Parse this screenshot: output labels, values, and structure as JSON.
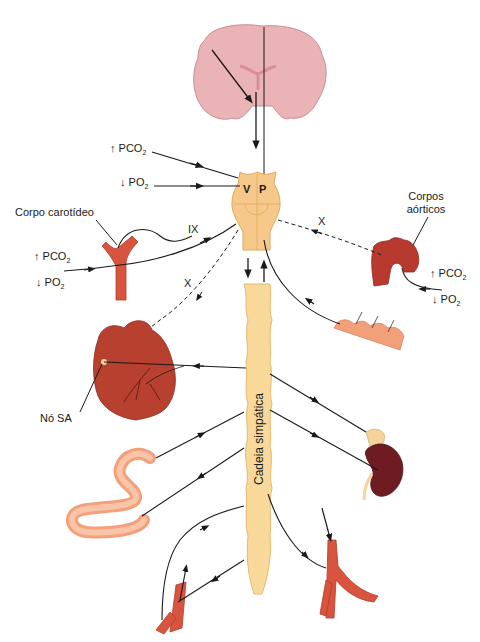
{
  "diagram": {
    "type": "physiology-diagram",
    "colors": {
      "brain": "#eab4b6",
      "brainstem": "#f6c98a",
      "chain": "#f8d99a",
      "vessel": "#d9543f",
      "heart": "#b8402f",
      "intestine": "#f4a07a",
      "skin": "#f2a07a",
      "kidney": "#6e1c22",
      "adrenal": "#f4d49a",
      "line": "#1a1a1a"
    },
    "brainstem": {
      "left_label": "V",
      "right_label": "P"
    },
    "left_inputs": [
      {
        "arrow": "↑",
        "text": "PCO",
        "sub": "2"
      },
      {
        "arrow": "↓",
        "text": "PO",
        "sub": "2"
      }
    ],
    "carotid": {
      "label": "Corpo carotídeo",
      "inputs": [
        {
          "arrow": "↑",
          "text": "PCO",
          "sub": "2"
        },
        {
          "arrow": "↓",
          "text": "PO",
          "sub": "2"
        }
      ],
      "nerve": "IX"
    },
    "aortic": {
      "label_line1": "Corpos",
      "label_line2": "aórticos",
      "inputs": [
        {
          "arrow": "↑",
          "text": "PCO",
          "sub": "2"
        },
        {
          "arrow": "↓",
          "text": "PO",
          "sub": "2"
        }
      ],
      "nerve": "X"
    },
    "heart": {
      "nerve": "X",
      "node_label": "Nó SA"
    },
    "chain": {
      "label": "Cadeia simpática"
    }
  }
}
